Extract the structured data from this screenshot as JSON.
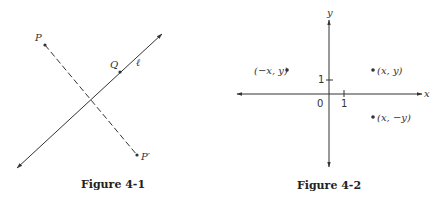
{
  "figures": [
    {
      "caption": "Figure 4-1",
      "labels": {
        "P": "P",
        "Q": "Q",
        "line": "ℓ",
        "P_prime": "P′"
      }
    },
    {
      "caption": "Figure 4-2",
      "axes": {
        "x_label": "x",
        "y_label": "y",
        "origin_label": "0",
        "x_tick_label": "1",
        "y_tick_label": "1"
      },
      "points": [
        {
          "label": "(−x, y)"
        },
        {
          "label": "(x, y)"
        },
        {
          "label": "(x, −y)"
        }
      ]
    }
  ],
  "colors": {
    "ink": "#333333",
    "background": "#ffffff"
  }
}
